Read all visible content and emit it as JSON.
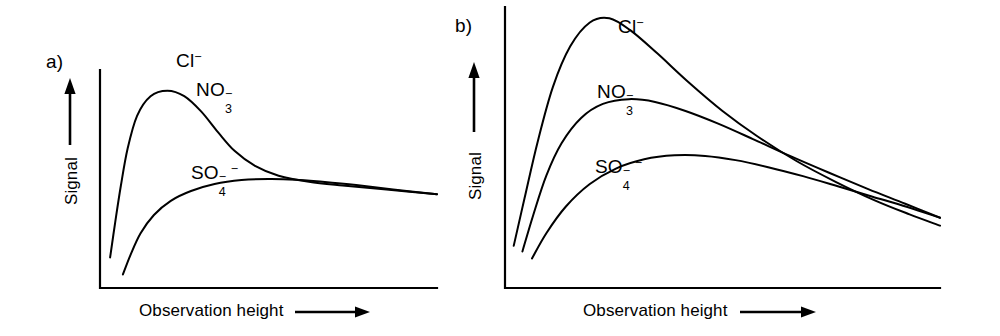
{
  "figure": {
    "background_color": "#ffffff",
    "ink_color": "#000000",
    "width": 1000,
    "height": 336
  },
  "panels": [
    {
      "id": "a",
      "letter": "a)",
      "letter_pos": [
        46,
        52
      ],
      "axes": {
        "origin": [
          100,
          288
        ],
        "x_end": 437,
        "y_top": 70,
        "line_width": 2.2
      },
      "y_axis": {
        "title": "Signal",
        "title_pos": [
          63,
          205
        ],
        "arrow": {
          "x": 70,
          "y_tail": 145,
          "y_head": 78
        }
      },
      "x_axis": {
        "title": "Observation height",
        "title_pos": [
          139,
          302
        ],
        "arrow": {
          "y": 312,
          "x_tail": 295,
          "x_head": 370
        }
      },
      "series_labels": [
        {
          "name": "chloride",
          "formula_html": "Cl<sup>&minus;</sup>",
          "pos": [
            176,
            51
          ]
        },
        {
          "name": "nitrate",
          "formula_html": "NO<span class=\"stack\"><span class=\"sup-c\">&minus;</span><span class=\"sub-d\">3</span></span>",
          "pos": [
            196,
            80
          ]
        },
        {
          "name": "sulfate",
          "formula_html": "SO<span class=\"stack\"><span class=\"sup-c\">&minus;</span><span class=\"sub-d\">4</span></span><sup>&minus;</sup>",
          "pos": [
            191,
            163
          ]
        }
      ]
    },
    {
      "id": "b",
      "letter": "b)",
      "letter_pos": [
        455,
        16
      ],
      "axes": {
        "origin": [
          505,
          288
        ],
        "x_end": 940,
        "y_top": 7,
        "line_width": 2.2
      },
      "y_axis": {
        "title": "Signal",
        "title_pos": [
          467,
          200
        ],
        "arrow": {
          "x": 474,
          "y_tail": 132,
          "y_head": 62
        }
      },
      "x_axis": {
        "title": "Observation height",
        "title_pos": [
          583,
          302
        ],
        "arrow": {
          "y": 312,
          "x_tail": 740,
          "x_head": 816
        }
      },
      "series_labels": [
        {
          "name": "chloride",
          "formula_html": "Cl<sup>&minus;</sup>",
          "pos": [
            618,
            17
          ]
        },
        {
          "name": "nitrate",
          "formula_html": "NO<span class=\"stack\"><span class=\"sup-c\">&minus;</span><span class=\"sub-d\">3</span></span>",
          "pos": [
            597,
            82
          ]
        },
        {
          "name": "sulfate",
          "formula_html": "SO<span class=\"stack\"><span class=\"sup-c\">&minus;</span><span class=\"sub-d\">4</span></span><sup>&minus;</sup>",
          "pos": [
            595,
            157
          ]
        }
      ]
    }
  ],
  "chart_data": {
    "type": "line",
    "title": "",
    "xlabel": "Observation height",
    "ylabel": "Signal",
    "grid": false,
    "legend": "inline-curve-labels",
    "axis_ticks": false,
    "axis_numbers": false,
    "panels": [
      {
        "panel": "a",
        "xlim": [
          0,
          1
        ],
        "ylim": [
          0,
          1
        ],
        "series": [
          {
            "name": "Cl- / NO3- (coincident)",
            "label": "Cl- , NO3-",
            "points_xy": [
              [
                0.03,
                0.14
              ],
              [
                0.045,
                0.3
              ],
              [
                0.062,
                0.47
              ],
              [
                0.082,
                0.64
              ],
              [
                0.11,
                0.79
              ],
              [
                0.15,
                0.88
              ],
              [
                0.2,
                0.905
              ],
              [
                0.25,
                0.88
              ],
              [
                0.3,
                0.81
              ],
              [
                0.35,
                0.715
              ],
              [
                0.4,
                0.628
              ],
              [
                0.46,
                0.56
              ],
              [
                0.53,
                0.515
              ],
              [
                0.62,
                0.487
              ],
              [
                0.72,
                0.47
              ],
              [
                0.85,
                0.452
              ],
              [
                1.0,
                0.43
              ]
            ],
            "peak_x": 0.205,
            "peak_y": 0.905
          },
          {
            "name": "SO4--",
            "label": "SO4--",
            "points_xy": [
              [
                0.068,
                0.062
              ],
              [
                0.09,
                0.15
              ],
              [
                0.12,
                0.25
              ],
              [
                0.16,
                0.335
              ],
              [
                0.21,
                0.4
              ],
              [
                0.27,
                0.445
              ],
              [
                0.34,
                0.477
              ],
              [
                0.42,
                0.495
              ],
              [
                0.5,
                0.5
              ],
              [
                0.58,
                0.497
              ],
              [
                0.66,
                0.487
              ],
              [
                0.76,
                0.472
              ],
              [
                0.87,
                0.452
              ],
              [
                1.0,
                0.43
              ]
            ],
            "peak_x": 0.505,
            "peak_y": 0.5
          }
        ]
      },
      {
        "panel": "b",
        "xlim": [
          0,
          1
        ],
        "ylim": [
          0,
          1
        ],
        "series": [
          {
            "name": "Cl-",
            "label": "Cl-",
            "points_xy": [
              [
                0.02,
                0.15
              ],
              [
                0.045,
                0.32
              ],
              [
                0.075,
                0.52
              ],
              [
                0.11,
                0.715
              ],
              [
                0.15,
                0.86
              ],
              [
                0.195,
                0.945
              ],
              [
                0.24,
                0.96
              ],
              [
                0.29,
                0.915
              ],
              [
                0.35,
                0.835
              ],
              [
                0.42,
                0.735
              ],
              [
                0.5,
                0.63
              ],
              [
                0.58,
                0.54
              ],
              [
                0.67,
                0.452
              ],
              [
                0.76,
                0.378
              ],
              [
                0.85,
                0.312
              ],
              [
                0.93,
                0.262
              ],
              [
                1.0,
                0.222
              ]
            ],
            "peak_x": 0.248,
            "peak_y": 0.96
          },
          {
            "name": "NO3-",
            "label": "NO3-",
            "points_xy": [
              [
                0.04,
                0.13
              ],
              [
                0.065,
                0.26
              ],
              [
                0.095,
                0.4
              ],
              [
                0.13,
                0.515
              ],
              [
                0.175,
                0.605
              ],
              [
                0.225,
                0.655
              ],
              [
                0.285,
                0.672
              ],
              [
                0.345,
                0.662
              ],
              [
                0.415,
                0.63
              ],
              [
                0.49,
                0.585
              ],
              [
                0.57,
                0.53
              ],
              [
                0.655,
                0.47
              ],
              [
                0.745,
                0.41
              ],
              [
                0.835,
                0.352
              ],
              [
                0.92,
                0.3
              ],
              [
                1.0,
                0.25
              ]
            ],
            "peak_x": 0.3,
            "peak_y": 0.672
          },
          {
            "name": "SO4--",
            "label": "SO4--",
            "points_xy": [
              [
                0.062,
                0.105
              ],
              [
                0.095,
                0.195
              ],
              [
                0.14,
                0.29
              ],
              [
                0.195,
                0.37
              ],
              [
                0.255,
                0.425
              ],
              [
                0.32,
                0.458
              ],
              [
                0.39,
                0.472
              ],
              [
                0.46,
                0.47
              ],
              [
                0.53,
                0.455
              ],
              [
                0.605,
                0.43
              ],
              [
                0.685,
                0.398
              ],
              [
                0.765,
                0.362
              ],
              [
                0.845,
                0.325
              ],
              [
                0.925,
                0.288
              ],
              [
                1.0,
                0.25
              ]
            ],
            "peak_x": 0.405,
            "peak_y": 0.473
          }
        ]
      }
    ]
  }
}
